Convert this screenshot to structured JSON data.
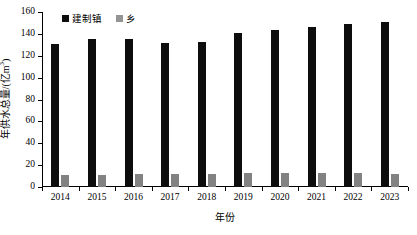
{
  "chart_data": {
    "type": "bar",
    "title": "",
    "xlabel": "年份",
    "ylabel": "年供水总量/(亿m³)",
    "ylabel_main": "年供水总量/(亿m",
    "ylabel_sup": "3",
    "ylabel_close": ")",
    "categories": [
      "2014",
      "2015",
      "2016",
      "2017",
      "2018",
      "2019",
      "2020",
      "2021",
      "2022",
      "2023"
    ],
    "series": [
      {
        "name": "建制镇",
        "color": "#0d0d0d",
        "values": [
          131,
          135,
          135,
          132,
          133,
          141,
          144,
          146,
          149,
          151
        ]
      },
      {
        "name": "乡",
        "color": "#828282",
        "values": [
          11,
          11,
          11.5,
          12,
          12,
          12.5,
          13,
          13,
          12.5,
          12
        ]
      }
    ],
    "ylim": [
      0,
      160
    ],
    "yticks": [
      0,
      20,
      40,
      60,
      80,
      100,
      120,
      140,
      160
    ],
    "ytick_labels": [
      "0",
      "20",
      "40",
      "60",
      "80",
      "100",
      "120",
      "140",
      "160"
    ],
    "grid": false,
    "legend_position": "top-left"
  }
}
